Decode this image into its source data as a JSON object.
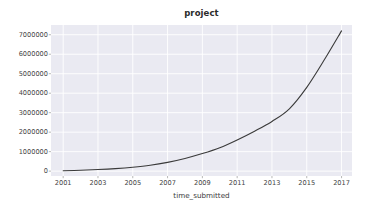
{
  "figure": {
    "title": "project",
    "background_color": "#ffffff",
    "plot_background_color": "#eaeaf2",
    "grid_color": "#ffffff",
    "line_color": "#3a3a3a",
    "tick_color": "#444444"
  },
  "chart_data": {
    "type": "line",
    "title": "project",
    "xlabel": "time_submitted",
    "ylabel": "",
    "xlim": [
      2000.3,
      2017.6
    ],
    "ylim": [
      -250000,
      7500000
    ],
    "grid": true,
    "legend": null,
    "x_ticks": [
      "2001",
      "2003",
      "2005",
      "2007",
      "2009",
      "2011",
      "2013",
      "2015",
      "2017"
    ],
    "x_tick_values": [
      2001,
      2003,
      2005,
      2007,
      2009,
      2011,
      2013,
      2015,
      2017
    ],
    "y_ticks": [
      "0",
      "1000000",
      "2000000",
      "3000000",
      "4000000",
      "5000000",
      "6000000",
      "7000000"
    ],
    "y_tick_values": [
      0,
      1000000,
      2000000,
      3000000,
      4000000,
      5000000,
      6000000,
      7000000
    ],
    "series": [
      {
        "name": "project",
        "x": [
          2001,
          2002,
          2003,
          2004,
          2005,
          2006,
          2007,
          2008,
          2009,
          2010,
          2011,
          2012,
          2013,
          2014,
          2015,
          2016,
          2017
        ],
        "values": [
          20000,
          45000,
          80000,
          130000,
          200000,
          300000,
          450000,
          650000,
          900000,
          1200000,
          1600000,
          2050000,
          2550000,
          3200000,
          4300000,
          5700000,
          7200000
        ]
      }
    ]
  }
}
